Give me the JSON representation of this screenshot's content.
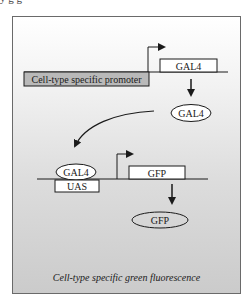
{
  "diagram": {
    "top_fragment_text": "y                                        g  g",
    "driver_construct": {
      "promoter_label": "Cell-type specific promoter",
      "gene_label": "GAL4"
    },
    "gal4_protein_label": "GAL4",
    "responder_construct": {
      "bound_protein_label": "GAL4",
      "enhancer_label": "UAS",
      "gene_label": "GFP"
    },
    "product_label": "GFP",
    "caption": "Cell-type specific green fluorescence",
    "colors": {
      "promoter_fill": "#b9b9b9",
      "box_fill": "#ffffff",
      "stroke": "#1a1a1a",
      "panel_top": "#ffffff",
      "panel_bottom": "#cbcbcb"
    },
    "edges": [
      {
        "from": "Cell-type specific promoter",
        "to": "GAL4 gene",
        "type": "transcription-start"
      },
      {
        "from": "GAL4 gene",
        "to": "GAL4 protein",
        "type": "expression"
      },
      {
        "from": "GAL4 protein",
        "to": "UAS",
        "type": "binding"
      },
      {
        "from": "UAS",
        "to": "GFP gene",
        "type": "transcription-start"
      },
      {
        "from": "GFP gene",
        "to": "GFP protein",
        "type": "expression"
      }
    ]
  }
}
